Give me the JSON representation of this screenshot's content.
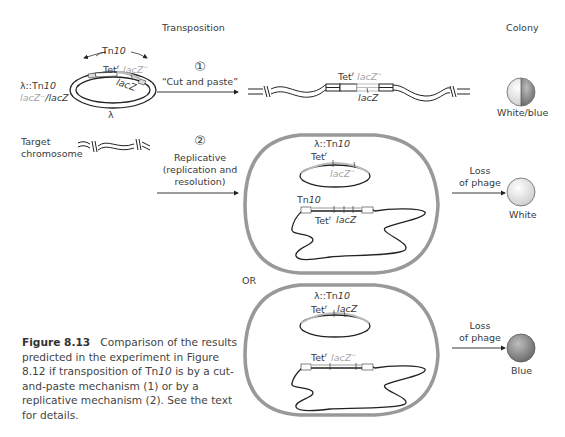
{
  "headers": {
    "transposition": "Transposition",
    "colony": "Colony"
  },
  "donor": {
    "name_prefix": "λ::Tn",
    "name_num": "10",
    "genotype_a": "lacZ⁻",
    "genotype_sep": "/",
    "genotype_b": "lacZ",
    "tn_label_prefix": "Tn",
    "tn_label_num": "10",
    "tet_label": "Tet",
    "tet_sup": "r",
    "lacz_minus": "lacZ",
    "lacz_minus_sup": "−",
    "lacz": "lacZ",
    "lambda": "λ"
  },
  "target": {
    "label_line1": "Target",
    "label_line2": "chromosome"
  },
  "pathway1": {
    "number": "①",
    "label": "“Cut and paste”",
    "product": {
      "tet": "Tet",
      "tet_sup": "r",
      "lacz_minus": "lacZ",
      "lacz_minus_sup": "−",
      "lacz": "lacZ"
    },
    "colony_label": "White/blue"
  },
  "pathway2": {
    "number": "②",
    "label_line1": "Replicative",
    "label_line2": "(replication and",
    "label_line3": "resolution)"
  },
  "cell1": {
    "phage_label_prefix": "λ::Tn",
    "phage_label_num": "10",
    "phage_tet": "Tet",
    "phage_tet_sup": "r",
    "phage_lacz": "lacZ",
    "phage_lacz_sup": "−",
    "chrom_tn_prefix": "Tn",
    "chrom_tn_num": "10",
    "chrom_tet": "Tet",
    "chrom_tet_sup": "r",
    "chrom_lacz": "lacZ",
    "loss_line1": "Loss",
    "loss_line2": "of phage",
    "colony_label": "White"
  },
  "or_label": "OR",
  "cell2": {
    "phage_label_prefix": "λ::Tn",
    "phage_label_num": "10",
    "phage_tet": "Tet",
    "phage_tet_sup": "r",
    "phage_lacz": "lacZ",
    "chrom_tet": "Tet",
    "chrom_tet_sup": "r",
    "chrom_lacz": "lacZ",
    "chrom_lacz_sup": "−",
    "loss_line1": "Loss",
    "loss_line2": "of phage",
    "colony_label": "Blue"
  },
  "caption": {
    "figure_label": "Figure 8.13",
    "text_1": "Comparison of the results predicted in the experiment in Figure 8.12 if transposition of Tn",
    "text_num": "10",
    "text_2": " is by a cut-and-paste mechanism (1) or by a replicative mechanism (2). See the text for details."
  },
  "colors": {
    "cell_outline": "#9a9a9a",
    "strand": "#1e1e1e",
    "grey_text": "#a5a5a5",
    "white_colony": "#e6e6e6",
    "blue_colony": "#8c8c8c"
  }
}
